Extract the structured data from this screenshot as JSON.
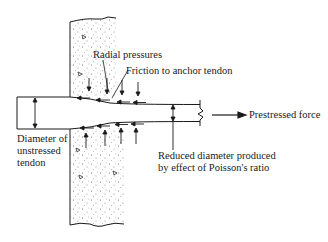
{
  "figure": {
    "labels": {
      "radial_pressures": "Radial pressures",
      "friction": "Friction to anchor tendon",
      "prestressed_force": "Prestressed force",
      "diameter_unstressed_line1": "Diameter of",
      "diameter_unstressed_line2": "unstressed",
      "diameter_unstressed_line3": "tendon",
      "reduced_diameter_line1": "Reduced diameter produced",
      "reduced_diameter_line2": "by effect of Poisson's ratio"
    },
    "colors": {
      "line": "#1a1a1a",
      "concrete_fill": "#ffffff",
      "stipple": "#555555"
    }
  }
}
